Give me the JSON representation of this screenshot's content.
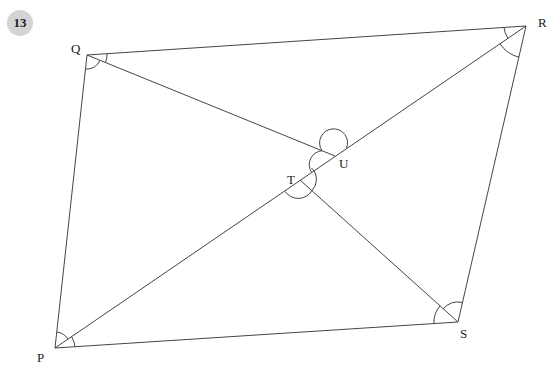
{
  "question": {
    "number": "13",
    "badge_color": "#d4d4d4"
  },
  "diagram": {
    "stroke_color": "#444444",
    "points": {
      "P": {
        "label": "P",
        "x": 55,
        "y": 348
      },
      "Q": {
        "label": "Q",
        "x": 87,
        "y": 55
      },
      "R": {
        "label": "R",
        "x": 526,
        "y": 26
      },
      "S": {
        "label": "S",
        "x": 458,
        "y": 322
      },
      "T": {
        "label": "T",
        "x": 300,
        "y": 180
      },
      "U": {
        "label": "U",
        "x": 335,
        "y": 156
      }
    },
    "segments": [
      "PQ",
      "QR",
      "RS",
      "SP",
      "PR",
      "QU",
      "TS"
    ],
    "angle_marks": [
      {
        "vertex": "Q",
        "between": [
          "R",
          "U"
        ]
      },
      {
        "vertex": "Q",
        "between": [
          "U",
          "P"
        ]
      },
      {
        "vertex": "R",
        "between": [
          "Q",
          "P"
        ]
      },
      {
        "vertex": "R",
        "between": [
          "P",
          "S"
        ]
      },
      {
        "vertex": "S",
        "between": [
          "T",
          "R"
        ]
      },
      {
        "vertex": "S",
        "between": [
          "P",
          "T"
        ]
      },
      {
        "vertex": "P",
        "between": [
          "Q",
          "R"
        ]
      },
      {
        "vertex": "P",
        "between": [
          "R",
          "S"
        ]
      },
      {
        "vertex": "U",
        "between": [
          "Q",
          "R"
        ],
        "reflex": true
      },
      {
        "vertex": "T",
        "between": [
          "P",
          "S"
        ],
        "reflex": true
      }
    ]
  }
}
